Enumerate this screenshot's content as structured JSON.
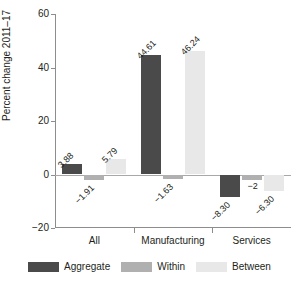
{
  "chart_data": {
    "type": "bar",
    "title": "",
    "xlabel": "",
    "ylabel": "Percent change 2011–17",
    "categories": [
      "All",
      "Manufacturing",
      "Services"
    ],
    "ylim": [
      -20,
      60
    ],
    "yticks": [
      60,
      40,
      20,
      0,
      -20
    ],
    "ytick_labels": [
      "60",
      "40",
      "20",
      "0",
      "−20"
    ],
    "grid": false,
    "legend_position": "bottom",
    "series": [
      {
        "name": "Aggregate",
        "color": "#4a4a4a",
        "values": [
          3.88,
          44.61,
          -8.3
        ],
        "labels": [
          "3.88",
          "44.61",
          "−8.30"
        ]
      },
      {
        "name": "Within",
        "color": "#b0b0b0",
        "values": [
          -1.91,
          -1.63,
          -2.0
        ],
        "labels": [
          "−1.91",
          "−1.63",
          "−2"
        ]
      },
      {
        "name": "Between",
        "color": "#e8e8e8",
        "values": [
          5.79,
          46.24,
          -6.3
        ],
        "labels": [
          "5.79",
          "46.24",
          "−6.30"
        ]
      }
    ]
  },
  "legend": {
    "items": [
      {
        "label": "Aggregate",
        "color": "#4a4a4a"
      },
      {
        "label": "Within",
        "color": "#b0b0b0"
      },
      {
        "label": "Between",
        "color": "#e8e8e8"
      }
    ]
  },
  "axis": {
    "y_title": "Percent change 2011–17"
  }
}
